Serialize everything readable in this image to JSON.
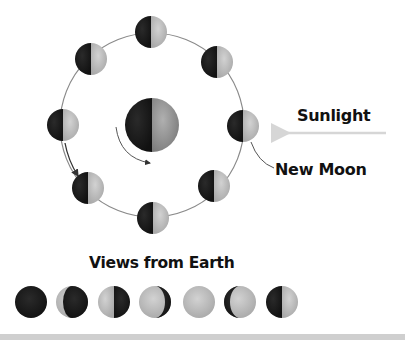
{
  "diagram": {
    "labels": {
      "sunlight": "Sunlight",
      "new_moon": "New Moon",
      "views_from_earth": "Views from Earth"
    },
    "colors": {
      "dark": "#1c1c1c",
      "light": "#c4c4c4",
      "earth_light": "#9a9a9a",
      "orbit": "#7a7a7a",
      "sun_arrow": "#d6d6d6",
      "bottom_bar": "#cfcfcf"
    },
    "earth": {
      "cx": 152,
      "cy": 125,
      "r": 27
    },
    "orbit": {
      "cx": 152,
      "cy": 125,
      "r": 92
    },
    "orbit_moons": [
      {
        "position": "top",
        "cx": 151,
        "cy": 32
      },
      {
        "position": "upper-right",
        "cx": 217,
        "cy": 62
      },
      {
        "position": "right",
        "cx": 243,
        "cy": 126
      },
      {
        "position": "lower-right",
        "cx": 214,
        "cy": 186
      },
      {
        "position": "bottom",
        "cx": 153,
        "cy": 218
      },
      {
        "position": "lower-left",
        "cx": 88,
        "cy": 188
      },
      {
        "position": "left",
        "cx": 63,
        "cy": 125
      },
      {
        "position": "upper-left",
        "cx": 91,
        "cy": 59
      }
    ],
    "views_from_earth": [
      {
        "phase": "new",
        "cx": 31
      },
      {
        "phase": "crescent",
        "cx": 72
      },
      {
        "phase": "quarter-left-lit",
        "cx": 114
      },
      {
        "phase": "gibbous-left-lit",
        "cx": 155
      },
      {
        "phase": "full",
        "cx": 199
      },
      {
        "phase": "gibbous-right-lit",
        "cx": 240
      },
      {
        "phase": "quarter-right-lit",
        "cx": 282
      }
    ]
  }
}
